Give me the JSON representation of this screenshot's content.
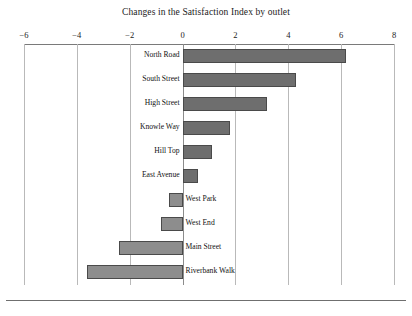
{
  "chart_data": {
    "type": "bar",
    "orientation": "horizontal",
    "title": "Changes in the Satisfaction Index by outlet",
    "xlabel": "",
    "ylabel": "",
    "xlim": [
      -6,
      8
    ],
    "grid": true,
    "legend": null,
    "xticks": [
      -6,
      -4,
      -2,
      0,
      2,
      4,
      6,
      8
    ],
    "xtick_labels": [
      "−6",
      "−4",
      "−2",
      "0",
      "2",
      "4",
      "6",
      "8"
    ],
    "categories": [
      "North Road",
      "South Street",
      "High Street",
      "Knowle Way",
      "Hill Top",
      "East Avenue",
      "West Park",
      "West End",
      "Main Street",
      "Riverbank Walk"
    ],
    "values": [
      6.2,
      4.3,
      3.2,
      1.8,
      1.1,
      0.6,
      -0.5,
      -0.8,
      -2.4,
      -3.6
    ],
    "colors": {
      "bar_positive": "#6e6e6e",
      "bar_negative": "#8d8d8d",
      "bar_edge": "#4a4a4a",
      "gridline": "#b9b9b9",
      "axis": "#7a7a7a",
      "background": "#ffffff",
      "text": "#1b1b1b"
    }
  }
}
